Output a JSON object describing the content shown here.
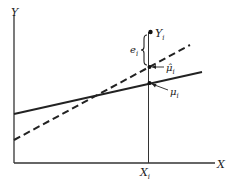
{
  "diagram": {
    "axes": {
      "x_label": "X",
      "y_label": "Y"
    },
    "xi_label": "X",
    "xi_sub": "i",
    "yi_label": "Y",
    "yi_sub": "i",
    "ei_label": "e",
    "ei_sub": "i",
    "mu_hat_label": "μ̂",
    "mu_hat_sub": "i",
    "mu_label": "μ",
    "mu_sub": "i",
    "lines": [
      {
        "name": "true regression line",
        "style": "solid"
      },
      {
        "name": "fitted regression line",
        "style": "dashed"
      }
    ],
    "colors": {
      "ink": "#222222",
      "background": "#ffffff"
    }
  }
}
